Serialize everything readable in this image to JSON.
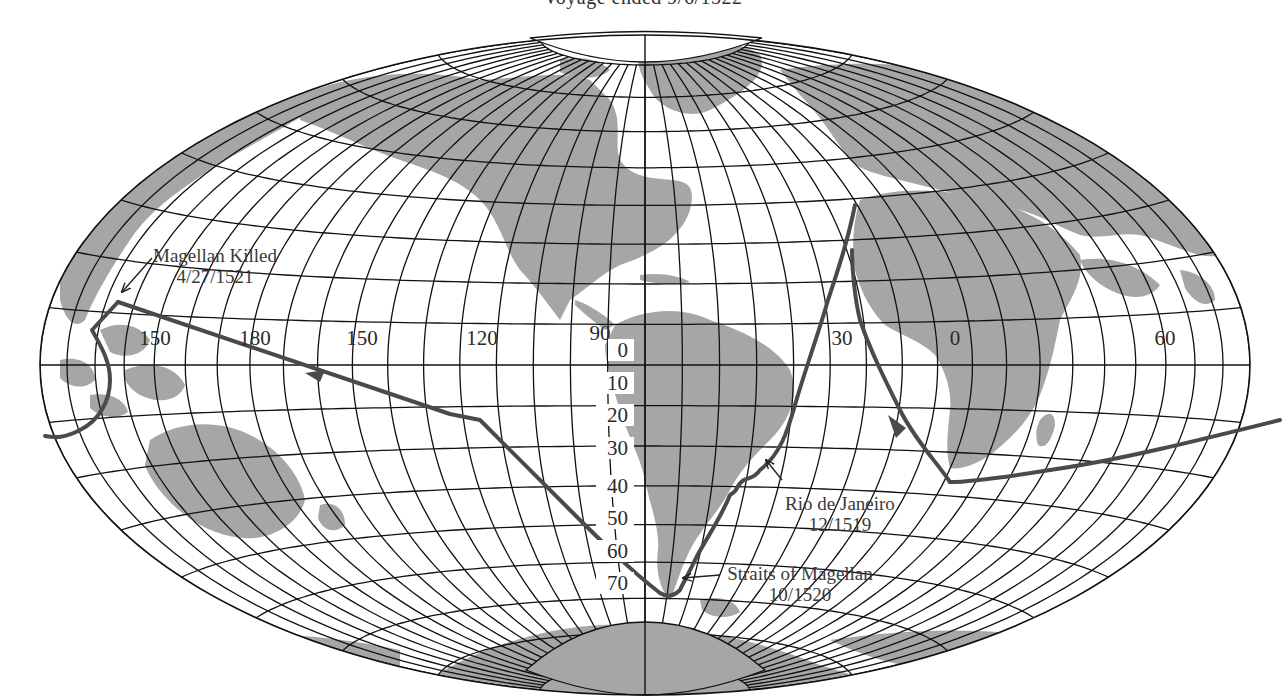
{
  "title": "Voyage ended 9/6/1522",
  "map": {
    "projection": "Hammer (equal-area oval)",
    "center": [
      645,
      365
    ],
    "rx": 605,
    "ry": 330,
    "land_color": "#a6a6a6",
    "line_color": "#111111",
    "route_color": "#4a4a4a",
    "longitude_labels": [
      {
        "text": "150",
        "x": 155,
        "y": 345
      },
      {
        "text": "180",
        "x": 255,
        "y": 345
      },
      {
        "text": "150",
        "x": 362,
        "y": 345
      },
      {
        "text": "120",
        "x": 482,
        "y": 345
      },
      {
        "text": "90",
        "x": 600,
        "y": 340
      },
      {
        "text": "30",
        "x": 842,
        "y": 345
      },
      {
        "text": "0",
        "x": 955,
        "y": 345
      },
      {
        "text": "60",
        "x": 1165,
        "y": 345
      }
    ],
    "latitude_labels": [
      {
        "text": "0",
        "y": 357
      },
      {
        "text": "10",
        "y": 390
      },
      {
        "text": "20",
        "y": 422
      },
      {
        "text": "30",
        "y": 455
      },
      {
        "text": "40",
        "y": 493
      },
      {
        "text": "50",
        "y": 525
      },
      {
        "text": "60",
        "y": 558
      },
      {
        "text": "70",
        "y": 590
      }
    ],
    "annotations": [
      {
        "id": "magellan-killed",
        "line1": "Magellan Killed",
        "line2": "4/27/1521",
        "x": 215,
        "y": 262
      },
      {
        "id": "rio-de-janeiro",
        "line1": "Rio de Janeiro",
        "line2": "12/1519",
        "x": 840,
        "y": 510
      },
      {
        "id": "straits-of-magellan",
        "line1": "Straits of Magellan",
        "line2": "10/1520",
        "x": 800,
        "y": 580
      }
    ]
  }
}
